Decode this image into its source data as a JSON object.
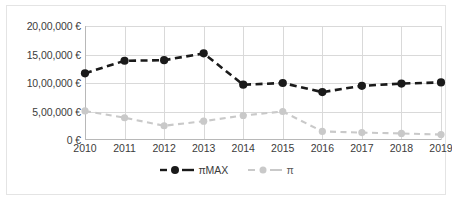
{
  "chart_data": {
    "type": "line",
    "title": "",
    "subtitle": "",
    "xlabel": "",
    "ylabel": "",
    "categories": [
      "2010",
      "2011",
      "2012",
      "2013",
      "2014",
      "2015",
      "2016",
      "2017",
      "2018",
      "2019"
    ],
    "ylim": [
      0,
      2000000
    ],
    "ytick_values": [
      0,
      500000,
      1000000,
      1500000,
      2000000
    ],
    "ytick_labels": [
      "0 €",
      "5,00,000 €",
      "10,00,000 €",
      "15,00,000 €",
      "20,00,000 €"
    ],
    "grid": "horizontal-and-vertical",
    "legend_position": "bottom-center",
    "currency": "€",
    "series": [
      {
        "name": "πMAX",
        "color": "#1a1a1a",
        "marker": "filled-circle",
        "linestyle": "dashed",
        "values": [
          1170000,
          1390000,
          1400000,
          1520000,
          970000,
          1000000,
          840000,
          950000,
          990000,
          1010000
        ]
      },
      {
        "name": "π",
        "color": "#c9c9c9",
        "marker": "filled-circle",
        "linestyle": "dashed",
        "values": [
          510000,
          390000,
          250000,
          330000,
          430000,
          500000,
          150000,
          130000,
          115000,
          95000
        ]
      }
    ]
  },
  "legend": {
    "items": [
      {
        "label": "πMAX"
      },
      {
        "label": "π"
      }
    ]
  }
}
